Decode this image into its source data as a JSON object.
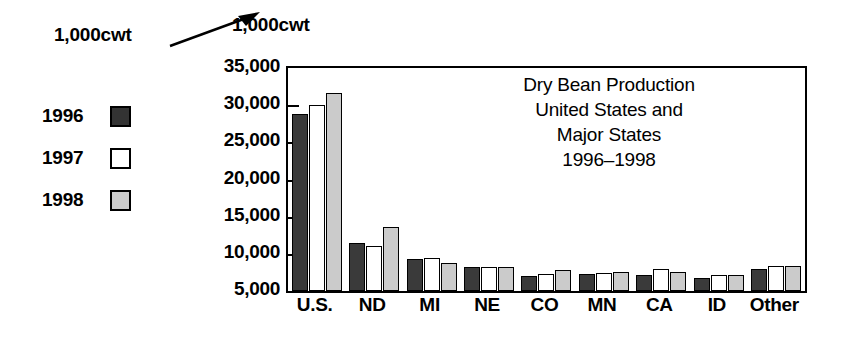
{
  "annotation": {
    "label": "1,000cwt",
    "arrow_icon": "arrow-up-right-icon"
  },
  "legend": {
    "position": "left",
    "items": [
      {
        "label": "1996",
        "color": "#3a3a3a",
        "swatch_name": "legend-swatch-1996"
      },
      {
        "label": "1997",
        "color": "#ffffff",
        "swatch_name": "legend-swatch-1997"
      },
      {
        "label": "1998",
        "color": "#cbcbcb",
        "swatch_name": "legend-swatch-1998"
      }
    ]
  },
  "chart_data": {
    "type": "bar",
    "title": "Dry Bean Production United States and Major States 1996–1998",
    "title_lines": [
      "Dry Bean Production",
      "United States and",
      "Major States",
      "1996–1998"
    ],
    "xlabel": "",
    "ylabel": "1,000cwt",
    "ylim": [
      5000,
      35000
    ],
    "ytick_labels": [
      "35,000",
      "30,000",
      "25,000",
      "20,000",
      "15,000",
      "10,000",
      "5,000"
    ],
    "ytick_values": [
      35000,
      30000,
      25000,
      20000,
      15000,
      10000,
      5000
    ],
    "grid": false,
    "legend_position": "outside-left",
    "categories": [
      "U.S.",
      "ND",
      "MI",
      "NE",
      "CO",
      "MN",
      "CA",
      "ID",
      "Other"
    ],
    "series": [
      {
        "name": "1996",
        "color": "#3a3a3a",
        "values": [
          28800,
          11500,
          9300,
          8200,
          7000,
          7300,
          7200,
          6800,
          8000
        ]
      },
      {
        "name": "1997",
        "color": "#ffffff",
        "values": [
          30000,
          11000,
          9400,
          8200,
          7300,
          7400,
          8000,
          7200,
          8400
        ]
      },
      {
        "name": "1998",
        "color": "#cbcbcb",
        "values": [
          31600,
          13600,
          8800,
          8200,
          7800,
          7600,
          7500,
          7200,
          8300
        ]
      }
    ]
  }
}
